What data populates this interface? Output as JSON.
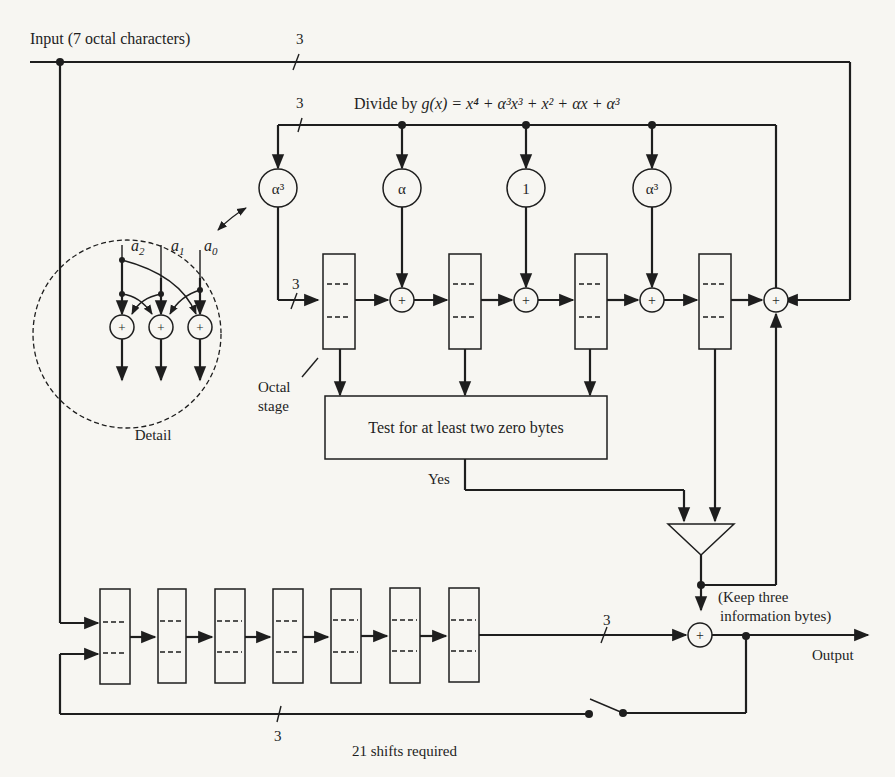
{
  "diagram": {
    "input_label": "Input (7 octal characters)",
    "bus_width_label": "3",
    "divide_label": "Divide by g(x) = x⁴ + α³x³ + x² + αx + α³",
    "divide_prefix": "Divide by ",
    "divide_formula": "g(x) = x⁴ + α³x³ + x² + αx + α³",
    "multipliers": [
      "α³",
      "α",
      "1",
      "α³"
    ],
    "adder_symbol": "+",
    "octal_stage_label_line1": "Octal",
    "octal_stage_label_line2": "stage",
    "test_box_label": "Test for at least two zero bytes",
    "yes_label": "Yes",
    "keep_label_line1": "(Keep three",
    "keep_label_line2": "information bytes)",
    "output_label": "Output",
    "shifts_label": "21 shifts required",
    "detail": {
      "label": "Detail",
      "inputs": [
        "a2",
        "a1",
        "a0"
      ],
      "inputs_display": [
        {
          "base": "a",
          "sub": "2"
        },
        {
          "base": "a",
          "sub": "1"
        },
        {
          "base": "a",
          "sub": "0"
        }
      ]
    },
    "decoder_stages": 4,
    "buffer_stages": 7
  }
}
